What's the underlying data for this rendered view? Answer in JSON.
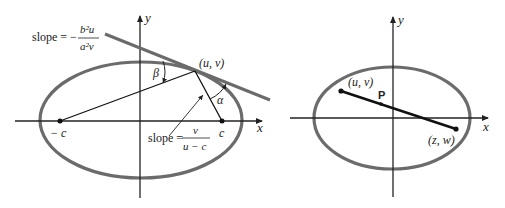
{
  "colors": {
    "ellipse": "#6b6b6b",
    "tangent": "#6b6b6b",
    "axis": "#222222",
    "segment": "#111111",
    "background": "#ffffff"
  },
  "left_figure": {
    "axis_x_label": "x",
    "axis_y_label": "y",
    "focus_left_label": "− c",
    "focus_right_label": "c",
    "point_label": "(u, v)",
    "angle_beta_label": "β",
    "angle_alpha_label": "α",
    "tangent_slope": {
      "prefix": "slope = −",
      "numerator": "b²u",
      "denominator": "a²v"
    },
    "focal_slope": {
      "prefix": "slope =",
      "numerator": "v",
      "denominator": "u − c"
    }
  },
  "right_figure": {
    "axis_x_label": "x",
    "axis_y_label": "y",
    "point_uv_label": "(u, v)",
    "point_p_label": "P",
    "point_zw_label": "(z, w)"
  }
}
